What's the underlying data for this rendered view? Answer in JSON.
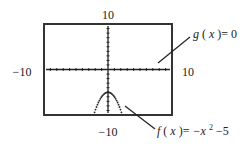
{
  "chart_data": {
    "type": "line",
    "title": "",
    "xlabel": "",
    "ylabel": "",
    "xlim": [
      -10,
      10
    ],
    "ylim": [
      -10,
      10
    ],
    "grid": false,
    "tick_step": 1,
    "window_labels": {
      "ymax": "10",
      "ymin": "−10",
      "xmin": "−10",
      "xmax": "10"
    },
    "series": [
      {
        "name": "g(x)=0",
        "expression": "0",
        "style": "solid",
        "annotation": {
          "func": "g",
          "var": "x",
          "rhs": "0"
        }
      },
      {
        "name": "f(x)=−x²−5",
        "expression": "-x^2-5",
        "style": "dotted",
        "x_domain": [
          -3,
          3
        ],
        "vertex": [
          0,
          -5
        ],
        "annotation": {
          "func": "f",
          "var": "x",
          "rhs_prefix": "−x",
          "exponent": "2",
          "rhs_suffix": " −5"
        }
      }
    ]
  },
  "colors": {
    "ink": "#222222",
    "frame": "#333333",
    "background": "#ffffff"
  }
}
